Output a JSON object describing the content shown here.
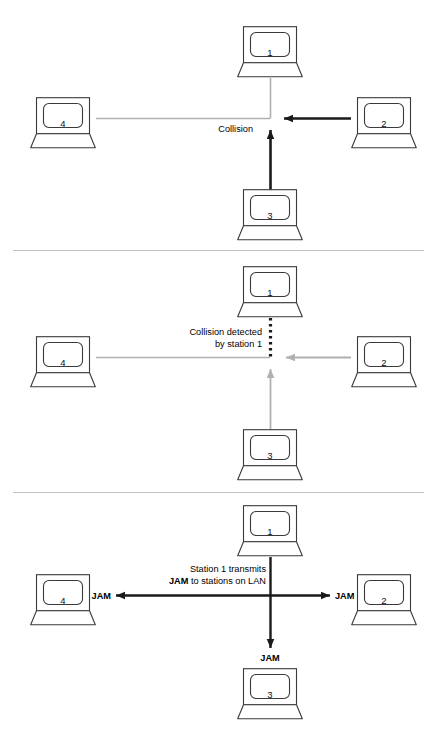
{
  "figure": {
    "type": "network-diagram",
    "topic": "CSMA/CD collision detection and JAM signal",
    "background_color": "#ffffff",
    "panel_count": 3
  },
  "colors": {
    "line_black": "#1a1a1a",
    "line_gray": "#b0b0b0",
    "separator": "#bfbfbf",
    "icon_stroke": "#3a3a3a",
    "text": "#000000"
  },
  "stations": {
    "one": "1",
    "two": "2",
    "three": "3",
    "four": "4"
  },
  "panels": [
    {
      "id": "panel-collision",
      "caption": "Collision",
      "stations": [
        "1",
        "2",
        "3",
        "4"
      ],
      "signals": [
        {
          "from": "2",
          "to": "center",
          "style": "solid-black-arrow"
        },
        {
          "from": "3",
          "to": "center",
          "style": "solid-black-arrow"
        },
        {
          "from": "1",
          "to": "center",
          "style": "plain-gray"
        },
        {
          "from": "4",
          "to": "center",
          "style": "plain-gray"
        }
      ]
    },
    {
      "id": "panel-detected",
      "caption_line1": "Collision detected",
      "caption_line2": "by station 1",
      "stations": [
        "1",
        "2",
        "3",
        "4"
      ],
      "signals": [
        {
          "from": "1",
          "to": "center",
          "style": "dotted-black"
        },
        {
          "from": "2",
          "to": "center",
          "style": "gray-arrow"
        },
        {
          "from": "3",
          "to": "center",
          "style": "gray-arrow"
        },
        {
          "from": "4",
          "to": "center",
          "style": "plain-gray"
        }
      ]
    },
    {
      "id": "panel-jam",
      "caption_line1_part1": "Station 1 transmits",
      "caption_line2_bold": "JAM",
      "caption_line2_rest": " to stations on LAN",
      "jam_label_left": "JAM",
      "jam_label_right": "JAM",
      "jam_label_bottom": "JAM",
      "stations": [
        "1",
        "2",
        "3",
        "4"
      ],
      "signals": [
        {
          "from": "1",
          "to": "4",
          "style": "solid-black-arrow"
        },
        {
          "from": "1",
          "to": "2",
          "style": "solid-black-arrow"
        },
        {
          "from": "1",
          "to": "3",
          "style": "solid-black-arrow"
        }
      ]
    }
  ],
  "icons": {
    "laptop": "laptop-icon"
  }
}
